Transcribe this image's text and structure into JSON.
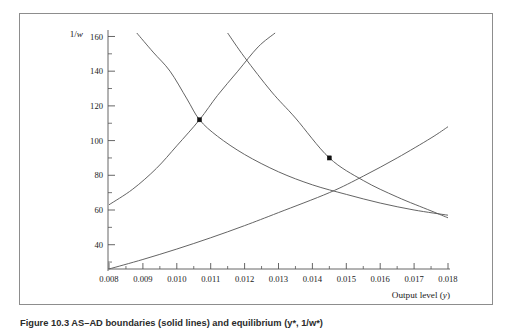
{
  "figure": {
    "caption": "Figure 10.3  AS–AD boundaries (solid lines) and equilibrium (y*, 1/w*)",
    "border_color": "#8d8d8d"
  },
  "chart_data": {
    "type": "line",
    "title": "",
    "xlabel": "Output level (y)",
    "ylabel": "1/w",
    "xlim": [
      0.008,
      0.018
    ],
    "ylim": [
      26,
      162
    ],
    "grid": false,
    "legend": "none",
    "xticks": [
      "0.008",
      "0.009",
      "0.010",
      "0.011",
      "0.012",
      "0.013",
      "0.014",
      "0.015",
      "0.016",
      "0.017",
      "0.018"
    ],
    "xtick_values": [
      0.008,
      0.009,
      0.01,
      0.011,
      0.012,
      0.013,
      0.014,
      0.015,
      0.016,
      0.017,
      0.018
    ],
    "yticks": [
      "40",
      "60",
      "80",
      "100",
      "120",
      "140",
      "160"
    ],
    "ytick_values": [
      40,
      60,
      80,
      100,
      120,
      140,
      160
    ],
    "minor_x_step": 0.0005,
    "minor_y_step": 10,
    "series": [
      {
        "name": "falling-curve-left",
        "style": "solid",
        "x": [
          0.00882,
          0.0093,
          0.0098,
          0.0103,
          0.01067,
          0.0112,
          0.012,
          0.013,
          0.014,
          0.015,
          0.016,
          0.017,
          0.018
        ],
        "y": [
          162.0,
          151.0,
          140.0,
          124.0,
          112.0,
          102.5,
          92.0,
          82.0,
          74.5,
          69.0,
          64.0,
          60.0,
          57.0
        ]
      },
      {
        "name": "rising-curve-steep",
        "style": "solid",
        "x": [
          0.008,
          0.0087,
          0.0094,
          0.01,
          0.01067,
          0.0112,
          0.0118,
          0.0124,
          0.0129
        ],
        "y": [
          63.0,
          72.0,
          84.0,
          97.0,
          112.0,
          126.0,
          140.0,
          154.0,
          162.0
        ]
      },
      {
        "name": "falling-curve-right",
        "style": "solid",
        "x": [
          0.0115,
          0.012,
          0.0128,
          0.0135,
          0.0145,
          0.0155,
          0.0165,
          0.0175,
          0.018
        ],
        "y": [
          162.0,
          148.0,
          128.0,
          113.0,
          90.0,
          77.0,
          67.5,
          59.5,
          55.5
        ]
      },
      {
        "name": "rising-curve-shallow",
        "style": "solid",
        "x": [
          0.008,
          0.009,
          0.01,
          0.011,
          0.012,
          0.013,
          0.0145,
          0.0155,
          0.0165,
          0.0175,
          0.018
        ],
        "y": [
          26.0,
          31.5,
          37.5,
          44.0,
          51.0,
          58.5,
          70.0,
          79.5,
          90.0,
          101.5,
          108.0
        ]
      }
    ],
    "markers": [
      {
        "name": "equilibrium-point-1",
        "x": 0.01067,
        "y": 112,
        "shape": "square",
        "color": "#111111"
      },
      {
        "name": "equilibrium-point-2",
        "x": 0.0145,
        "y": 90,
        "shape": "square",
        "color": "#111111"
      }
    ]
  }
}
